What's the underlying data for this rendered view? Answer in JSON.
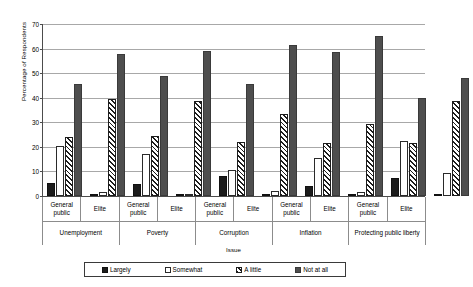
{
  "chart_data": {
    "type": "bar",
    "title": "",
    "xlabel": "Issue",
    "ylabel": "Percentage of Respondents",
    "ylim": [
      0,
      70
    ],
    "yticks": [
      0,
      10,
      20,
      30,
      40,
      50,
      60,
      70
    ],
    "grid": true,
    "legend_position": "bottom",
    "legend": [
      "Largely",
      "Somewhat",
      "A little",
      "Not at all"
    ],
    "series": [
      {
        "name": "Largely",
        "color": "#1c1c1c",
        "fill": "solid-black",
        "values": [
          5.5,
          0.5,
          5.0,
          0.5,
          8.0,
          0.5,
          4.0,
          1.0,
          7.5,
          1.0
        ]
      },
      {
        "name": "Somewhat",
        "color": "#ffffff",
        "fill": "open-white",
        "values": [
          20.5,
          1.5,
          17.0,
          1.0,
          10.5,
          2.0,
          15.5,
          1.5,
          22.5,
          9.5
        ]
      },
      {
        "name": "A little",
        "color": "#ffffff",
        "fill": "diagonal-hatch",
        "values": [
          24.0,
          39.5,
          24.5,
          38.5,
          22.0,
          33.5,
          21.5,
          29.5,
          21.5,
          38.5
        ]
      },
      {
        "name": "Not at all",
        "color": "#4e4e4e",
        "fill": "solid-gray",
        "values": [
          45.5,
          58.0,
          49.0,
          59.0,
          45.5,
          61.5,
          58.5,
          65.0,
          40.0,
          48.0
        ]
      }
    ],
    "categories": [
      "Unemployment - General public",
      "Unemployment - Elite",
      "Poverty - General public",
      "Poverty - Elite",
      "Corruption - General public",
      "Corruption - Elite",
      "Inflation - General public",
      "Inflation - Elite",
      "Protecting public liberty - General public",
      "Protecting public liberty - Elite"
    ],
    "issues": [
      {
        "name": "Unemployment",
        "audiences": [
          {
            "label": "General public",
            "values": {
              "Largely": 5.5,
              "Somewhat": 20.5,
              "A little": 24.0,
              "Not at all": 45.5
            }
          },
          {
            "label": "Elite",
            "values": {
              "Largely": 0.5,
              "Somewhat": 1.5,
              "A little": 39.5,
              "Not at all": 58.0
            }
          }
        ]
      },
      {
        "name": "Poverty",
        "audiences": [
          {
            "label": "General public",
            "values": {
              "Largely": 5.0,
              "Somewhat": 17.0,
              "A little": 24.5,
              "Not at all": 49.0
            }
          },
          {
            "label": "Elite",
            "values": {
              "Largely": 0.5,
              "Somewhat": 1.0,
              "A little": 38.5,
              "Not at all": 59.0
            }
          }
        ]
      },
      {
        "name": "Corruption",
        "audiences": [
          {
            "label": "General public",
            "values": {
              "Largely": 8.0,
              "Somewhat": 10.5,
              "A little": 22.0,
              "Not at all": 45.5
            }
          },
          {
            "label": "Elite",
            "values": {
              "Largely": 0.5,
              "Somewhat": 2.0,
              "A little": 33.5,
              "Not at all": 61.5
            }
          }
        ]
      },
      {
        "name": "Inflation",
        "audiences": [
          {
            "label": "General public",
            "values": {
              "Largely": 4.0,
              "Somewhat": 15.5,
              "A little": 21.5,
              "Not at all": 58.5
            }
          },
          {
            "label": "Elite",
            "values": {
              "Largely": 1.0,
              "Somewhat": 1.5,
              "A little": 29.5,
              "Not at all": 65.0
            }
          }
        ]
      },
      {
        "name": "Protecting public liberty",
        "audiences": [
          {
            "label": "General public",
            "values": {
              "Largely": 7.5,
              "Somewhat": 22.5,
              "A little": 21.5,
              "Not at all": 40.0
            }
          },
          {
            "label": "Elite",
            "values": {
              "Largely": 1.0,
              "Somewhat": 9.5,
              "A little": 38.5,
              "Not at all": 48.0
            }
          }
        ]
      }
    ]
  }
}
